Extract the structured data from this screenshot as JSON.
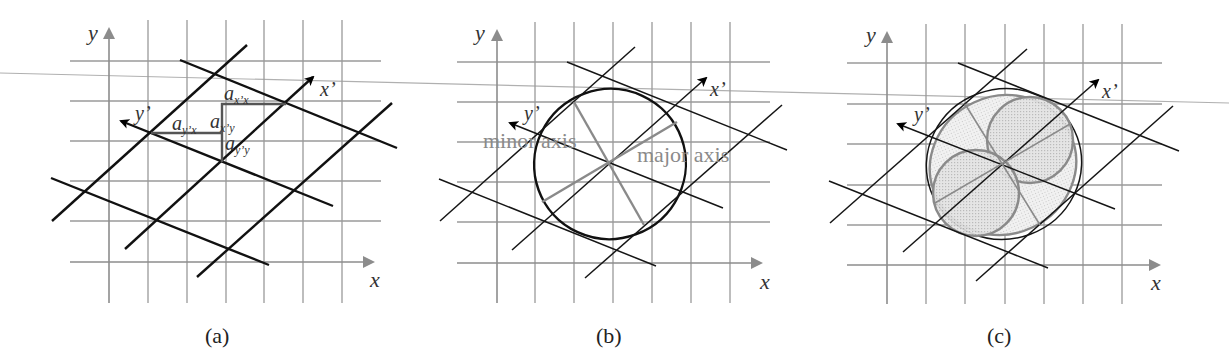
{
  "figure": {
    "panels": [
      {
        "id": "a",
        "caption": "(a)",
        "axis_labels": {
          "x": "x",
          "y": "y",
          "x_prime": "x’",
          "y_prime": "y’"
        },
        "coefficient_labels": [
          {
            "base": "a",
            "sub": "x’x"
          },
          {
            "base": "a",
            "sub": "y’x"
          },
          {
            "base": "a",
            "sub": "x’y"
          },
          {
            "base": "a",
            "sub": "y’y"
          }
        ]
      },
      {
        "id": "b",
        "caption": "(b)",
        "axis_labels": {
          "x": "x",
          "y": "y",
          "x_prime": "x’",
          "y_prime": "y’"
        },
        "annotations": {
          "minor_axis": "minor axis",
          "major_axis": "major axis"
        }
      },
      {
        "id": "c",
        "caption": "(c)",
        "axis_labels": {
          "x": "x",
          "y": "y",
          "x_prime": "x’",
          "y_prime": "y’"
        }
      }
    ],
    "colors": {
      "grid": "#9a9a9a",
      "rotated_grid": "#111111",
      "ellipse_fill": "#e6e6e6",
      "annotation": "#8a8a8a"
    }
  }
}
